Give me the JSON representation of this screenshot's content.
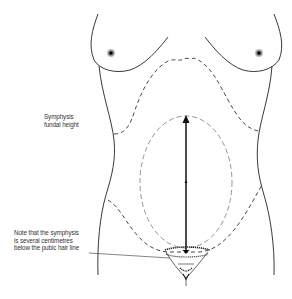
{
  "figure": {
    "labels": {
      "measurement": [
        "Symphysis",
        "fundal height"
      ],
      "note": [
        "Note that the symphysis",
        "is several centimetres",
        "below the pubic hair line"
      ]
    },
    "colors": {
      "outline": "#222222",
      "dashed_outline": "#333333",
      "uterus_dashed": "#888888",
      "arrow": "#111111",
      "text": "#333333"
    }
  }
}
